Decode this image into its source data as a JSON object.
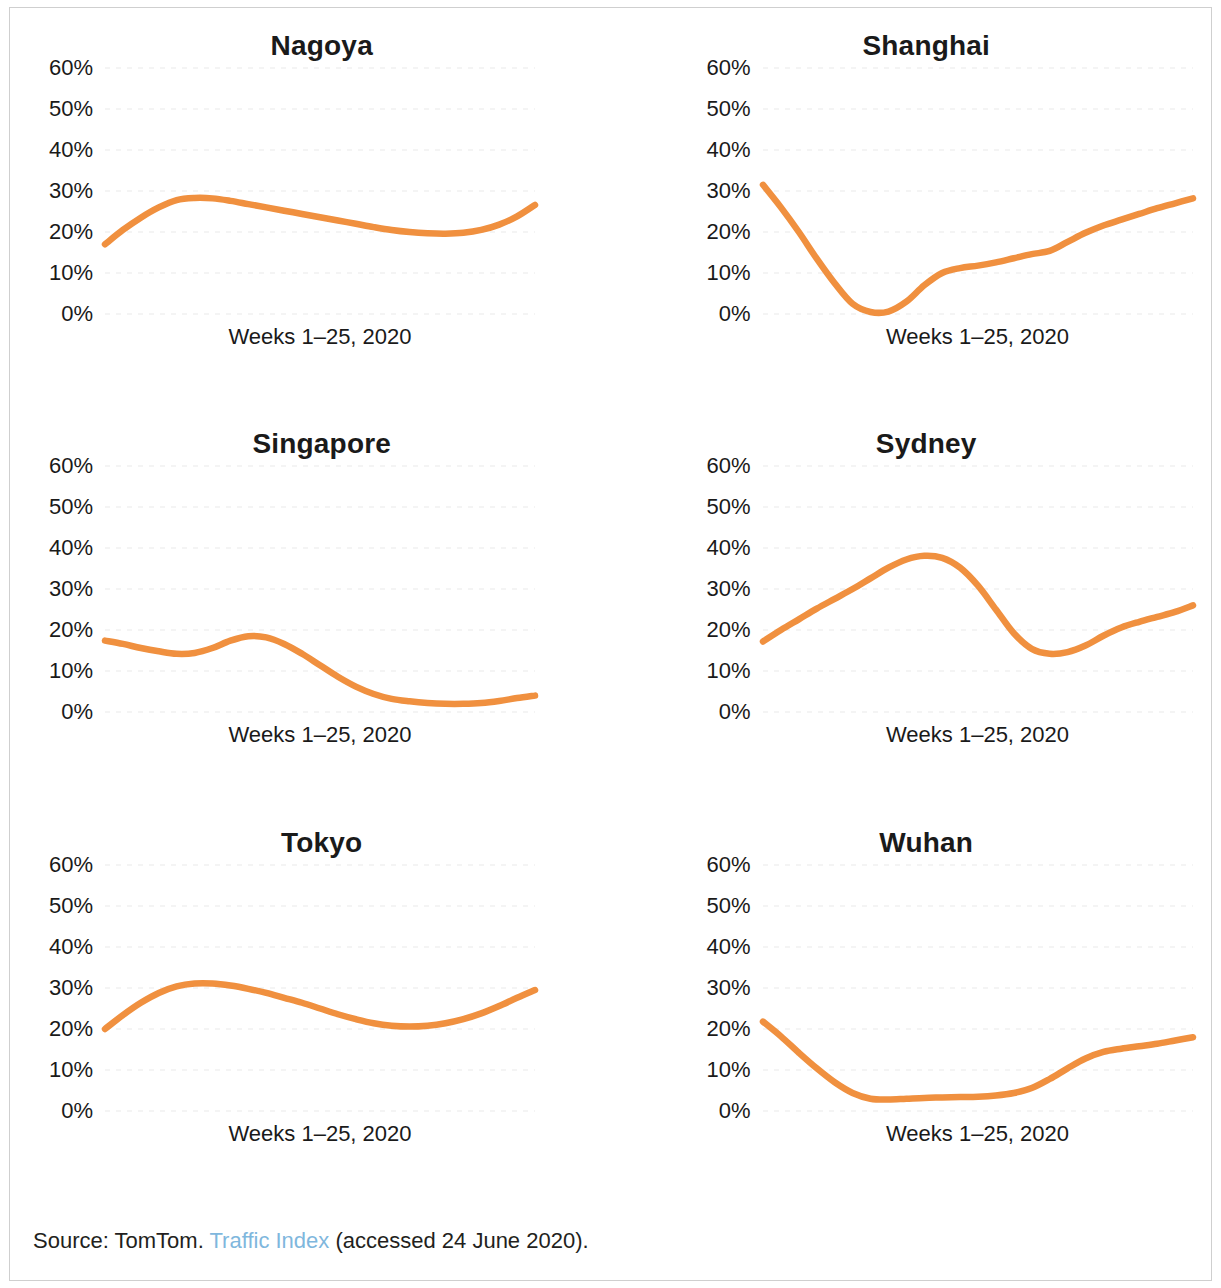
{
  "figure": {
    "source_prefix": "Source: TomTom. ",
    "source_link": "Traffic Index",
    "source_suffix": " (accessed 24 June 2020)."
  },
  "chart_data": [
    {
      "type": "line",
      "title": "Nagoya",
      "xlabel": "Weeks 1–25, 2020",
      "ylabel": "",
      "xlim": [
        1,
        25
      ],
      "ylim": [
        0,
        60
      ],
      "yticks": [
        "0%",
        "10%",
        "20%",
        "30%",
        "40%",
        "50%",
        "60%"
      ],
      "ytick_values": [
        0,
        10,
        20,
        30,
        40,
        50,
        60
      ],
      "grid": true,
      "legend": "none",
      "color": "#F0903F",
      "x": [
        1,
        2,
        3,
        4,
        5,
        6,
        7,
        8,
        9,
        10,
        11,
        12,
        13,
        14,
        15,
        16,
        17,
        18,
        19,
        20,
        21,
        22,
        23,
        24,
        25
      ],
      "values": [
        17.0,
        20.5,
        23.5,
        26.0,
        27.8,
        28.3,
        28.2,
        27.6,
        26.8,
        26.0,
        25.2,
        24.4,
        23.6,
        22.8,
        22.0,
        21.2,
        20.5,
        20.0,
        19.7,
        19.6,
        19.8,
        20.5,
        21.8,
        23.8,
        26.6
      ]
    },
    {
      "type": "line",
      "title": "Shanghai",
      "xlabel": "Weeks 1–25, 2020",
      "ylabel": "",
      "xlim": [
        1,
        25
      ],
      "ylim": [
        0,
        60
      ],
      "yticks": [
        "0%",
        "10%",
        "20%",
        "30%",
        "40%",
        "50%",
        "60%"
      ],
      "ytick_values": [
        0,
        10,
        20,
        30,
        40,
        50,
        60
      ],
      "grid": true,
      "legend": "none",
      "color": "#F0903F",
      "x": [
        1,
        2,
        3,
        4,
        5,
        6,
        7,
        8,
        9,
        10,
        11,
        12,
        13,
        14,
        15,
        16,
        17,
        18,
        19,
        20,
        21,
        22,
        23,
        24,
        25
      ],
      "values": [
        31.5,
        26.0,
        20.0,
        13.5,
        7.5,
        2.5,
        0.5,
        0.6,
        3.0,
        7.0,
        10.0,
        11.2,
        11.8,
        12.6,
        13.6,
        14.6,
        15.4,
        17.6,
        19.8,
        21.6,
        23.0,
        24.4,
        25.8,
        27.0,
        28.2
      ]
    },
    {
      "type": "line",
      "title": "Singapore",
      "xlabel": "Weeks 1–25, 2020",
      "ylabel": "",
      "xlim": [
        1,
        25
      ],
      "ylim": [
        0,
        60
      ],
      "yticks": [
        "0%",
        "10%",
        "20%",
        "30%",
        "40%",
        "50%",
        "60%"
      ],
      "ytick_values": [
        0,
        10,
        20,
        30,
        40,
        50,
        60
      ],
      "grid": true,
      "legend": "none",
      "color": "#F0903F",
      "x": [
        1,
        2,
        3,
        4,
        5,
        6,
        7,
        8,
        9,
        10,
        11,
        12,
        13,
        14,
        15,
        16,
        17,
        18,
        19,
        20,
        21,
        22,
        23,
        24,
        25
      ],
      "values": [
        17.4,
        16.6,
        15.6,
        14.8,
        14.2,
        14.4,
        15.6,
        17.4,
        18.5,
        18.2,
        16.6,
        14.2,
        11.4,
        8.6,
        6.2,
        4.4,
        3.2,
        2.6,
        2.2,
        2.0,
        2.0,
        2.2,
        2.7,
        3.4,
        4.0
      ]
    },
    {
      "type": "line",
      "title": "Sydney",
      "xlabel": "Weeks 1–25, 2020",
      "ylabel": "",
      "xlim": [
        1,
        25
      ],
      "ylim": [
        0,
        60
      ],
      "yticks": [
        "0%",
        "10%",
        "20%",
        "30%",
        "40%",
        "50%",
        "60%"
      ],
      "ytick_values": [
        0,
        10,
        20,
        30,
        40,
        50,
        60
      ],
      "grid": true,
      "legend": "none",
      "color": "#F0903F",
      "x": [
        1,
        2,
        3,
        4,
        5,
        6,
        7,
        8,
        9,
        10,
        11,
        12,
        13,
        14,
        15,
        16,
        17,
        18,
        19,
        20,
        21,
        22,
        23,
        24,
        25
      ],
      "values": [
        17.2,
        20.0,
        22.6,
        25.2,
        27.6,
        30.0,
        32.6,
        35.2,
        37.2,
        38.1,
        37.6,
        35.2,
        30.8,
        25.0,
        19.2,
        15.4,
        14.2,
        14.6,
        16.2,
        18.6,
        20.6,
        22.0,
        23.2,
        24.4,
        26.0
      ]
    },
    {
      "type": "line",
      "title": "Tokyo",
      "xlabel": "Weeks 1–25, 2020",
      "ylabel": "",
      "xlim": [
        1,
        25
      ],
      "ylim": [
        0,
        60
      ],
      "yticks": [
        "0%",
        "10%",
        "20%",
        "30%",
        "40%",
        "50%",
        "60%"
      ],
      "ytick_values": [
        0,
        10,
        20,
        30,
        40,
        50,
        60
      ],
      "grid": true,
      "legend": "none",
      "color": "#F0903F",
      "x": [
        1,
        2,
        3,
        4,
        5,
        6,
        7,
        8,
        9,
        10,
        11,
        12,
        13,
        14,
        15,
        16,
        17,
        18,
        19,
        20,
        21,
        22,
        23,
        24,
        25
      ],
      "values": [
        20.0,
        23.4,
        26.4,
        28.8,
        30.4,
        31.1,
        31.1,
        30.6,
        29.8,
        28.8,
        27.6,
        26.4,
        25.0,
        23.6,
        22.4,
        21.4,
        20.8,
        20.6,
        20.8,
        21.4,
        22.4,
        23.8,
        25.6,
        27.6,
        29.5
      ]
    },
    {
      "type": "line",
      "title": "Wuhan",
      "xlabel": "Weeks 1–25, 2020",
      "ylabel": "",
      "xlim": [
        1,
        25
      ],
      "ylim": [
        0,
        60
      ],
      "yticks": [
        "0%",
        "10%",
        "20%",
        "30%",
        "40%",
        "50%",
        "60%"
      ],
      "ytick_values": [
        0,
        10,
        20,
        30,
        40,
        50,
        60
      ],
      "grid": true,
      "legend": "none",
      "color": "#F0903F",
      "x": [
        1,
        2,
        3,
        4,
        5,
        6,
        7,
        8,
        9,
        10,
        11,
        12,
        13,
        14,
        15,
        16,
        17,
        18,
        19,
        20,
        21,
        22,
        23,
        24,
        25
      ],
      "values": [
        21.8,
        18.2,
        14.2,
        10.4,
        7.0,
        4.4,
        3.0,
        2.8,
        3.0,
        3.2,
        3.3,
        3.4,
        3.5,
        3.8,
        4.4,
        5.6,
        7.8,
        10.4,
        12.8,
        14.4,
        15.2,
        15.8,
        16.4,
        17.2,
        18.0
      ]
    }
  ]
}
